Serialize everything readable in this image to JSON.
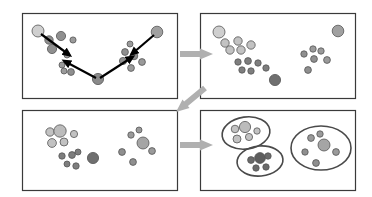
{
  "figure": {
    "type": "diagram",
    "panel_count": 4,
    "colors": {
      "background": "#ffffff",
      "panel_border": "#3a3a3a",
      "panel_border_light": "#8c8c8c",
      "dot_light": "#cccccc",
      "dot_mid": "#a8a8a8",
      "dot_dark": "#777777",
      "dot_darker": "#5d5d5d",
      "dot_outline": "#555555",
      "arrow_black": "#000000",
      "arrow_gray": "#b0b0b0",
      "cluster_ring": "#4a4a4a"
    }
  },
  "panels": [
    {
      "id": "panel-top-left",
      "name": "initial-points-with-shift-vectors",
      "x": 22,
      "y": 13,
      "w": 155,
      "h": 85,
      "border": "#3a3a3a",
      "points": [
        {
          "cx": 38,
          "cy": 31,
          "r": 6.0,
          "fill": "#cfcfcf"
        },
        {
          "cx": 49,
          "cy": 40,
          "r": 4.2,
          "fill": "#8f8f8f"
        },
        {
          "cx": 61,
          "cy": 36,
          "r": 4.6,
          "fill": "#8f8f8f"
        },
        {
          "cx": 73,
          "cy": 40,
          "r": 3.1,
          "fill": "#9a9a9a"
        },
        {
          "cx": 52,
          "cy": 49,
          "r": 4.6,
          "fill": "#8f8f8f"
        },
        {
          "cx": 67,
          "cy": 55,
          "r": 3.0,
          "fill": "#9a9a9a"
        },
        {
          "cx": 62,
          "cy": 65,
          "r": 3.0,
          "fill": "#9a9a9a"
        },
        {
          "cx": 64,
          "cy": 71,
          "r": 3.0,
          "fill": "#9a9a9a"
        },
        {
          "cx": 71,
          "cy": 72,
          "r": 3.4,
          "fill": "#8f8f8f"
        },
        {
          "cx": 98,
          "cy": 79,
          "r": 5.6,
          "fill": "#8a8a8a"
        },
        {
          "cx": 125,
          "cy": 52,
          "r": 3.4,
          "fill": "#8f8f8f"
        },
        {
          "cx": 130,
          "cy": 44,
          "r": 3.0,
          "fill": "#9a9a9a"
        },
        {
          "cx": 123,
          "cy": 61,
          "r": 3.6,
          "fill": "#8f8f8f"
        },
        {
          "cx": 134,
          "cy": 56,
          "r": 3.8,
          "fill": "#8f8f8f"
        },
        {
          "cx": 142,
          "cy": 62,
          "r": 3.4,
          "fill": "#9a9a9a"
        },
        {
          "cx": 131,
          "cy": 68,
          "r": 3.4,
          "fill": "#9a9a9a"
        },
        {
          "cx": 157,
          "cy": 32,
          "r": 5.8,
          "fill": "#a0a0a0"
        }
      ],
      "arrows": [
        {
          "x1": 41,
          "y1": 34,
          "x2": 68,
          "y2": 54,
          "color": "#000000",
          "width": 2.2
        },
        {
          "x1": 96,
          "y1": 78,
          "x2": 66,
          "y2": 62,
          "color": "#000000",
          "width": 2.2
        },
        {
          "x1": 100,
          "y1": 78,
          "x2": 131,
          "y2": 58,
          "color": "#000000",
          "width": 2.2
        },
        {
          "x1": 154,
          "y1": 35,
          "x2": 133,
          "y2": 53,
          "color": "#000000",
          "width": 2.2
        }
      ]
    },
    {
      "id": "panel-top-right",
      "name": "points-after-first-shift",
      "x": 200,
      "y": 13,
      "w": 155,
      "h": 85,
      "border": "#3a3a3a",
      "points": [
        {
          "cx": 219,
          "cy": 32,
          "r": 6.0,
          "fill": "#cfcfcf"
        },
        {
          "cx": 225,
          "cy": 43,
          "r": 4.2,
          "fill": "#c2c2c2"
        },
        {
          "cx": 238,
          "cy": 41,
          "r": 4.2,
          "fill": "#c2c2c2"
        },
        {
          "cx": 251,
          "cy": 45,
          "r": 4.2,
          "fill": "#c2c2c2"
        },
        {
          "cx": 230,
          "cy": 50,
          "r": 4.2,
          "fill": "#c2c2c2"
        },
        {
          "cx": 241,
          "cy": 50,
          "r": 4.2,
          "fill": "#c2c2c2"
        },
        {
          "cx": 238,
          "cy": 62,
          "r": 3.2,
          "fill": "#7e7e7e"
        },
        {
          "cx": 248,
          "cy": 61,
          "r": 3.4,
          "fill": "#7e7e7e"
        },
        {
          "cx": 258,
          "cy": 63,
          "r": 3.2,
          "fill": "#7e7e7e"
        },
        {
          "cx": 242,
          "cy": 70,
          "r": 3.2,
          "fill": "#7e7e7e"
        },
        {
          "cx": 251,
          "cy": 71,
          "r": 3.2,
          "fill": "#7e7e7e"
        },
        {
          "cx": 266,
          "cy": 68,
          "r": 3.2,
          "fill": "#7e7e7e"
        },
        {
          "cx": 275,
          "cy": 80,
          "r": 5.6,
          "fill": "#6f6f6f"
        },
        {
          "cx": 304,
          "cy": 54,
          "r": 3.2,
          "fill": "#8f8f8f"
        },
        {
          "cx": 313,
          "cy": 49,
          "r": 3.2,
          "fill": "#9a9a9a"
        },
        {
          "cx": 321,
          "cy": 51,
          "r": 3.2,
          "fill": "#9a9a9a"
        },
        {
          "cx": 314,
          "cy": 59,
          "r": 3.4,
          "fill": "#8f8f8f"
        },
        {
          "cx": 327,
          "cy": 60,
          "r": 3.4,
          "fill": "#9a9a9a"
        },
        {
          "cx": 308,
          "cy": 70,
          "r": 3.4,
          "fill": "#8f8f8f"
        },
        {
          "cx": 338,
          "cy": 31,
          "r": 5.8,
          "fill": "#a0a0a0"
        }
      ],
      "arrows": []
    },
    {
      "id": "panel-bottom-left",
      "name": "points-after-convergence",
      "x": 22,
      "y": 110,
      "w": 155,
      "h": 80,
      "border": "#3a3a3a",
      "points": [
        {
          "cx": 50,
          "cy": 132,
          "r": 4.2,
          "fill": "#c2c2c2"
        },
        {
          "cx": 60,
          "cy": 131,
          "r": 6.2,
          "fill": "#bcbcbc"
        },
        {
          "cx": 74,
          "cy": 134,
          "r": 3.6,
          "fill": "#c2c2c2"
        },
        {
          "cx": 52,
          "cy": 143,
          "r": 4.4,
          "fill": "#c2c2c2"
        },
        {
          "cx": 64,
          "cy": 142,
          "r": 4.0,
          "fill": "#c2c2c2"
        },
        {
          "cx": 62,
          "cy": 156,
          "r": 3.2,
          "fill": "#7e7e7e"
        },
        {
          "cx": 72,
          "cy": 155,
          "r": 3.4,
          "fill": "#7e7e7e"
        },
        {
          "cx": 78,
          "cy": 152,
          "r": 3.0,
          "fill": "#7e7e7e"
        },
        {
          "cx": 67,
          "cy": 164,
          "r": 3.0,
          "fill": "#7e7e7e"
        },
        {
          "cx": 76,
          "cy": 166,
          "r": 3.2,
          "fill": "#7e7e7e"
        },
        {
          "cx": 93,
          "cy": 158,
          "r": 5.6,
          "fill": "#6f6f6f"
        },
        {
          "cx": 131,
          "cy": 135,
          "r": 3.2,
          "fill": "#9a9a9a"
        },
        {
          "cx": 139,
          "cy": 130,
          "r": 3.0,
          "fill": "#9a9a9a"
        },
        {
          "cx": 143,
          "cy": 143,
          "r": 6.0,
          "fill": "#a5a5a5"
        },
        {
          "cx": 122,
          "cy": 152,
          "r": 3.4,
          "fill": "#8f8f8f"
        },
        {
          "cx": 152,
          "cy": 151,
          "r": 3.4,
          "fill": "#9a9a9a"
        },
        {
          "cx": 133,
          "cy": 162,
          "r": 3.4,
          "fill": "#8f8f8f"
        }
      ],
      "arrows": []
    },
    {
      "id": "panel-bottom-right",
      "name": "final-clusters-with-boundaries",
      "x": 200,
      "y": 110,
      "w": 155,
      "h": 80,
      "border": "#3a3a3a",
      "points": [
        {
          "cx": 235,
          "cy": 129,
          "r": 3.8,
          "fill": "#c2c2c2"
        },
        {
          "cx": 245,
          "cy": 127,
          "r": 5.6,
          "fill": "#bcbcbc"
        },
        {
          "cx": 257,
          "cy": 131,
          "r": 3.2,
          "fill": "#c2c2c2"
        },
        {
          "cx": 237,
          "cy": 139,
          "r": 4.0,
          "fill": "#c2c2c2"
        },
        {
          "cx": 249,
          "cy": 137,
          "r": 3.6,
          "fill": "#c2c2c2"
        },
        {
          "cx": 251,
          "cy": 160,
          "r": 3.4,
          "fill": "#6a6a6a"
        },
        {
          "cx": 260,
          "cy": 158,
          "r": 5.4,
          "fill": "#5d5d5d"
        },
        {
          "cx": 268,
          "cy": 156,
          "r": 3.2,
          "fill": "#6a6a6a"
        },
        {
          "cx": 256,
          "cy": 168,
          "r": 3.2,
          "fill": "#6a6a6a"
        },
        {
          "cx": 266,
          "cy": 167,
          "r": 3.2,
          "fill": "#6a6a6a"
        },
        {
          "cx": 311,
          "cy": 138,
          "r": 3.4,
          "fill": "#9a9a9a"
        },
        {
          "cx": 320,
          "cy": 134,
          "r": 3.2,
          "fill": "#9a9a9a"
        },
        {
          "cx": 324,
          "cy": 145,
          "r": 6.0,
          "fill": "#a5a5a5"
        },
        {
          "cx": 305,
          "cy": 152,
          "r": 3.2,
          "fill": "#8f8f8f"
        },
        {
          "cx": 336,
          "cy": 152,
          "r": 3.4,
          "fill": "#9a9a9a"
        },
        {
          "cx": 316,
          "cy": 163,
          "r": 3.4,
          "fill": "#8f8f8f"
        }
      ],
      "cluster_rings": [
        {
          "cx": 246,
          "cy": 133,
          "rx": 24,
          "ry": 16,
          "rot": -8
        },
        {
          "cx": 260,
          "cy": 161,
          "rx": 23,
          "ry": 15,
          "rot": -5
        },
        {
          "cx": 321,
          "cy": 148,
          "rx": 30,
          "ry": 22,
          "rot": 0
        }
      ],
      "arrows": []
    }
  ],
  "flow_arrows": [
    {
      "id": "arrow-top",
      "name": "arrow-top-left-to-top-right",
      "from": "panel-top-left",
      "to": "panel-top-right",
      "direction": "right",
      "x": 180,
      "y": 54,
      "length": 20,
      "color": "#b0b0b0"
    },
    {
      "id": "arrow-diag",
      "name": "arrow-top-right-to-bottom-left",
      "from": "panel-top-right",
      "to": "panel-bottom-left",
      "direction": "down-left",
      "x1": 205,
      "y1": 88,
      "x2": 176,
      "y2": 112,
      "color": "#b0b0b0"
    },
    {
      "id": "arrow-bottom",
      "name": "arrow-bottom-left-to-bottom-right",
      "from": "panel-bottom-left",
      "to": "panel-bottom-right",
      "direction": "right",
      "x": 180,
      "y": 145,
      "length": 20,
      "color": "#b0b0b0"
    }
  ]
}
